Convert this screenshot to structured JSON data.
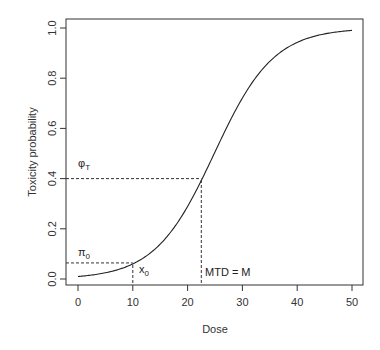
{
  "chart_data": {
    "type": "line",
    "title": "",
    "xlabel": "Dose",
    "ylabel": "Toxicity probability",
    "xlim": [
      0,
      50
    ],
    "ylim": [
      0,
      1
    ],
    "x_ticks": [
      0,
      10,
      20,
      30,
      40,
      50
    ],
    "y_ticks": [
      0.0,
      0.2,
      0.4,
      0.6,
      0.8,
      1.0
    ],
    "x_tick_labels": [
      "0",
      "10",
      "20",
      "30",
      "40",
      "50"
    ],
    "y_tick_labels": [
      "0.0",
      "0.2",
      "0.4",
      "0.6",
      "0.8",
      "1.0"
    ],
    "grid": false,
    "legend": null,
    "series": [
      {
        "name": "dose-toxicity curve",
        "model": "logistic",
        "params": {
          "a": -4.6,
          "b": 0.185
        },
        "x": [
          0,
          5,
          10,
          15,
          20,
          22.5,
          25,
          30,
          35,
          40,
          45,
          50
        ],
        "y": [
          0.01,
          0.025,
          0.064,
          0.15,
          0.31,
          0.41,
          0.52,
          0.73,
          0.87,
          0.94,
          0.98,
          0.99
        ]
      }
    ],
    "annotations": [
      {
        "label": "φ_T",
        "type": "hline",
        "y": 0.4,
        "x_from": 0,
        "x_to": 22.5,
        "style": "dashed"
      },
      {
        "label": "MTD = M",
        "type": "vline",
        "x": 22.5,
        "y_from": 0,
        "y_to": 0.4,
        "style": "dashed"
      },
      {
        "label": "π_0",
        "type": "hline",
        "y": 0.064,
        "x_from": 0,
        "x_to": 10,
        "style": "dashed"
      },
      {
        "label": "x_0",
        "type": "vline",
        "x": 10,
        "y_from": 0,
        "y_to": 0.064,
        "style": "dashed"
      }
    ]
  },
  "labels": {
    "xlabel": "Dose",
    "ylabel": "Toxicity probability",
    "phi_main": "φ",
    "phi_sub": "T",
    "pi_main": "π",
    "pi_sub": "0",
    "x0_main": "x",
    "x0_sub": "0",
    "mtd": "MTD = M"
  }
}
